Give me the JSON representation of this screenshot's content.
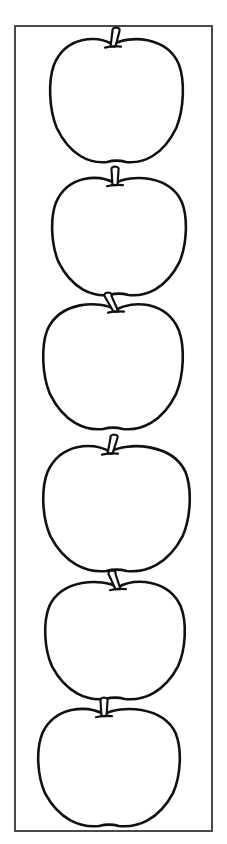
{
  "page": {
    "title": "",
    "width": 227,
    "height": 844,
    "background": "#ffffff"
  },
  "frame": {
    "border_color": "#4a4a4a",
    "x": 14,
    "y": 25,
    "width": 199,
    "height": 807
  },
  "apples": {
    "count": 6,
    "stroke_color": "#111111",
    "fill_color": "#ffffff",
    "items": [
      {
        "cx": 117,
        "top": 37,
        "bottom": 163,
        "left": 50,
        "right": 183,
        "stem_x": 113,
        "stem_tilt": 3
      },
      {
        "cx": 119,
        "top": 176,
        "bottom": 296,
        "left": 52,
        "right": 186,
        "stem_x": 115,
        "stem_tilt": 0
      },
      {
        "cx": 113,
        "top": 302,
        "bottom": 430,
        "left": 43,
        "right": 183,
        "stem_x": 116,
        "stem_tilt": -8
      },
      {
        "cx": 116,
        "top": 444,
        "bottom": 572,
        "left": 43,
        "right": 190,
        "stem_x": 110,
        "stem_tilt": 4
      },
      {
        "cx": 115,
        "top": 580,
        "bottom": 700,
        "left": 45,
        "right": 185,
        "stem_x": 118,
        "stem_tilt": -6
      },
      {
        "cx": 109,
        "top": 707,
        "bottom": 827,
        "left": 38,
        "right": 180,
        "stem_x": 104,
        "stem_tilt": 0
      }
    ]
  }
}
